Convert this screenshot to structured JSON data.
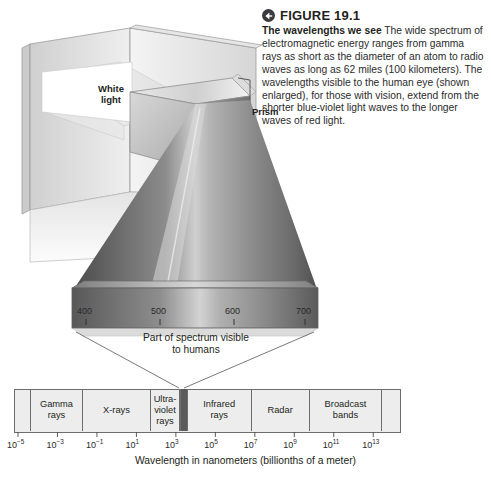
{
  "figure": {
    "number": "FIGURE 19.1",
    "badge_icon": "back-arrow-icon",
    "title": "The wavelengths we see",
    "body": " The wide spectrum of electromagnetic energy ranges from gamma rays as short as the diameter of an atom to radio waves as long as 62 miles (100 kilometers). The wavelengths visible to the human eye (shown enlarged), for those with vision, extend from the shorter blue-violet light waves to the longer waves of red light."
  },
  "illustration": {
    "white_light_label": "White\nlight",
    "white_light_line1": "White",
    "white_light_line2": "light",
    "prism_label": "Prism",
    "visible_caption_line1": "Part of spectrum visible",
    "visible_caption_line2": "to humans",
    "wavelength_ticks": [
      "400",
      "500",
      "600",
      "700"
    ]
  },
  "chart_data": {
    "type": "bar",
    "xlabel": "Wavelength in nanometers (billionths of a meter)",
    "ylabel": "",
    "axis_scale": "log10",
    "tick_base": "10",
    "tick_exponents": [
      "-5",
      "-3",
      "-1",
      "1",
      "3",
      "5",
      "7",
      "9",
      "11",
      "13"
    ],
    "tick_labels": [
      "10⁻⁵",
      "10⁻³",
      "10⁻¹",
      "10¹",
      "10³",
      "10⁵",
      "10⁷",
      "10⁹",
      "10¹¹",
      "10¹³"
    ],
    "categories": [
      "",
      "Gamma rays",
      "X-rays",
      "Ultra-violet rays",
      "visible",
      "Infrared rays",
      "Radar",
      "Broadcast bands",
      ""
    ],
    "bands": [
      {
        "label": "",
        "line1": "",
        "line2": "",
        "line3": "",
        "left_pct": 0.0,
        "width_pct": 4.4,
        "visible": false
      },
      {
        "label": "Gamma rays",
        "line1": "Gamma",
        "line2": "rays",
        "line3": "",
        "left_pct": 4.4,
        "width_pct": 13.4,
        "visible": false
      },
      {
        "label": "X-rays",
        "line1": "X-rays",
        "line2": "",
        "line3": "",
        "left_pct": 17.8,
        "width_pct": 17.6,
        "visible": false
      },
      {
        "label": "Ultra-violet rays",
        "line1": "Ultra-",
        "line2": "violet",
        "line3": "rays",
        "left_pct": 35.4,
        "width_pct": 7.5,
        "visible": false
      },
      {
        "label": "visible light",
        "line1": "",
        "line2": "",
        "line3": "",
        "left_pct": 42.9,
        "width_pct": 2.0,
        "visible": true
      },
      {
        "label": "Infrared rays",
        "line1": "Infrared",
        "line2": "rays",
        "line3": "",
        "left_pct": 44.9,
        "width_pct": 16.5,
        "visible": false
      },
      {
        "label": "Radar",
        "line1": "Radar",
        "line2": "",
        "line3": "",
        "left_pct": 61.4,
        "width_pct": 15.0,
        "visible": false
      },
      {
        "label": "Broadcast bands",
        "line1": "Broadcast",
        "line2": "bands",
        "line3": "",
        "left_pct": 76.4,
        "width_pct": 18.8,
        "visible": false
      },
      {
        "label": "",
        "line1": "",
        "line2": "",
        "line3": "",
        "left_pct": 95.2,
        "width_pct": 4.8,
        "visible": false
      }
    ],
    "visible_spectrum": {
      "nm_min": 400,
      "nm_max": 700,
      "ticks": [
        400,
        500,
        600,
        700
      ]
    },
    "grid": false,
    "legend": "none"
  },
  "colors": {
    "bar_fill": "#ededed",
    "bar_stroke": "#6d6d6d",
    "visible_band": "#5b5b5b",
    "text": "#231f20",
    "badge": "#3b3b3f",
    "caption_text": "#2b2b2b"
  }
}
